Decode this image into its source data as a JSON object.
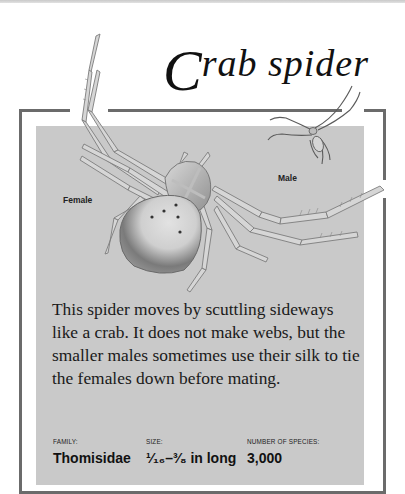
{
  "header": {
    "title_initial": "C",
    "title_rest": "rab spider"
  },
  "illustration": {
    "labels": {
      "female": "Female",
      "male": "Male"
    }
  },
  "description": "This spider moves by scuttling sideways like a crab. It does not make webs, but the smaller males sometimes use their silk to tie the females down before mating.",
  "facts": [
    {
      "label": "FAMILY:",
      "value": "Thomisidae"
    },
    {
      "label": "SIZE:",
      "value": "¹⁄₁₆–³⁄₈ in long"
    },
    {
      "label": "NUMBER OF SPECIES:",
      "value": "3,000"
    }
  ],
  "colors": {
    "panel": "#c9c9c9",
    "frame": "#6b6b6b",
    "background": "#ffffff",
    "text": "#111111"
  }
}
